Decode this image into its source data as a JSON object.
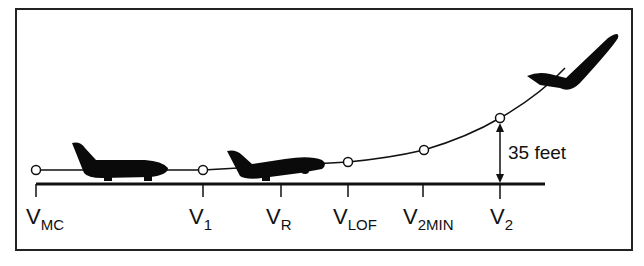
{
  "diagram": {
    "height_annotation": "35 feet",
    "speeds": [
      {
        "main": "V",
        "sub": "MC"
      },
      {
        "main": "V",
        "sub": "1"
      },
      {
        "main": "V",
        "sub": "R"
      },
      {
        "main": "V",
        "sub": "LOF"
      },
      {
        "main": "V",
        "sub": "2MIN"
      },
      {
        "main": "V",
        "sub": "2"
      }
    ],
    "colors": {
      "line": "#111111",
      "aircraft": "#0a0a0a",
      "background": "#ffffff"
    }
  }
}
